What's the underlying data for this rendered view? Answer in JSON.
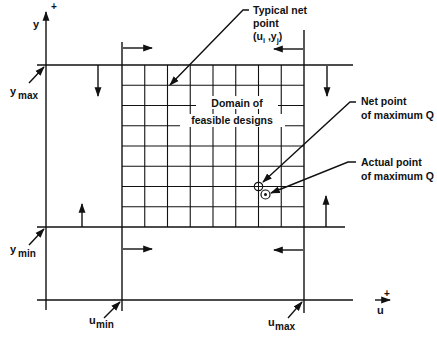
{
  "diagram": {
    "axes": {
      "y_label": "y",
      "y_plus": "+",
      "u_label": "u",
      "u_plus": "+"
    },
    "bounds": {
      "y_max": {
        "base": "y",
        "sub": "max"
      },
      "y_min": {
        "base": "y",
        "sub": "min"
      },
      "u_min": {
        "base": "u",
        "sub": "min"
      },
      "u_max": {
        "base": "u",
        "sub": "max"
      }
    },
    "grid": {
      "columns": 8,
      "rows": 8,
      "domain_label_line1": "Domain of",
      "domain_label_line2": "feasible designs"
    },
    "annotations": {
      "typical_net_point_line1": "Typical net",
      "typical_net_point_line2": "point",
      "typical_net_point_coord_open": "(u",
      "typical_net_point_coord_i": "i",
      "typical_net_point_coord_mid": " ,y",
      "typical_net_point_coord_j": "j",
      "typical_net_point_coord_close": ")",
      "net_point_max_line1": "Net point",
      "net_point_max_line2": "of maximum Q",
      "actual_point_max_line1": "Actual point",
      "actual_point_max_line2": "of maximum Q"
    },
    "markers": {
      "net_point_symbol": "circle-plus",
      "actual_point_symbol": "circle-dot"
    }
  }
}
